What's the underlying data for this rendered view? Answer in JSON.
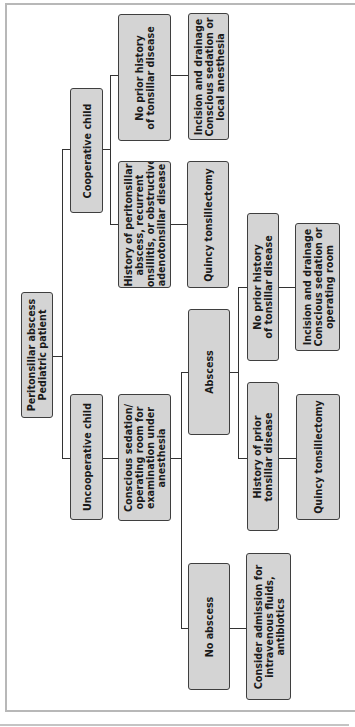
{
  "diagram": {
    "type": "flowchart",
    "orientation": "rotated-90-ccw",
    "colors": {
      "box_fill": "#d4d4d4",
      "box_border": "#3f3f3f",
      "line": "#333333",
      "frame": "#b8b8b8"
    },
    "nodes": {
      "root": {
        "label": "Peritonsillar abscess\nPediatric patient"
      },
      "cooperative": {
        "label": "Cooperative child"
      },
      "uncooperative": {
        "label": "Uncooperative child"
      },
      "coop_history": {
        "label": "History of peritonsillar\nabscess, recurrent\ntonsillitis, or obstructive\nadenotonsillar disease"
      },
      "coop_no_history": {
        "label": "No prior history\nof tonsillar disease"
      },
      "coop_quincy": {
        "label": "Quincy tonsillectomy"
      },
      "coop_incision": {
        "label": "Incision and drainage\nConscious sedation or\nlocal anesthesia"
      },
      "sedation_exam": {
        "label": "Conscious sedation/\noperating room for\nexamination under\nanesthesia"
      },
      "abscess": {
        "label": "Abscess"
      },
      "no_abscess": {
        "label": "No abscess"
      },
      "admission": {
        "label": "Consider admission for\nintravenous fluids,\nantibiotics"
      },
      "abs_no_history": {
        "label": "No prior history\nof tonsillar disease"
      },
      "abs_history": {
        "label": "History of prior\ntonsillar disease"
      },
      "abs_incision": {
        "label": "Incision and drainage\nConscious sedation or\noperating room"
      },
      "abs_quincy": {
        "label": "Quincy tonsillectomy"
      }
    },
    "edges": [
      [
        "root",
        "cooperative"
      ],
      [
        "root",
        "uncooperative"
      ],
      [
        "cooperative",
        "coop_history"
      ],
      [
        "cooperative",
        "coop_no_history"
      ],
      [
        "coop_history",
        "coop_quincy"
      ],
      [
        "coop_no_history",
        "coop_incision"
      ],
      [
        "uncooperative",
        "sedation_exam"
      ],
      [
        "sedation_exam",
        "abscess"
      ],
      [
        "sedation_exam",
        "no_abscess"
      ],
      [
        "no_abscess",
        "admission"
      ],
      [
        "abscess",
        "abs_no_history"
      ],
      [
        "abscess",
        "abs_history"
      ],
      [
        "abs_no_history",
        "abs_incision"
      ],
      [
        "abs_history",
        "abs_quincy"
      ]
    ]
  }
}
